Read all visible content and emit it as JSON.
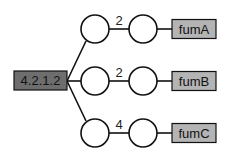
{
  "diagram": {
    "type": "tree",
    "root": {
      "label": "4.2.1.2",
      "fill": "#6e6e6e"
    },
    "branches": [
      {
        "edge_label": "2",
        "leaf": {
          "label": "fumA",
          "fill": "#b4b4b4"
        }
      },
      {
        "edge_label": "2",
        "leaf": {
          "label": "fumB",
          "fill": "#b4b4b4"
        }
      },
      {
        "edge_label": "4",
        "leaf": {
          "label": "fumC",
          "fill": "#b4b4b4"
        }
      }
    ],
    "colors": {
      "stroke": "#111111",
      "circle_fill": "#ffffff",
      "root_fill": "#6e6e6e",
      "leaf_fill": "#b4b4b4"
    }
  }
}
